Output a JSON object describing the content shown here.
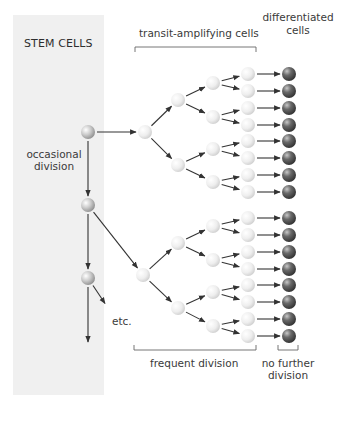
{
  "labels": {
    "stem_cells": "STEM CELLS",
    "transit_amplifying": "transit-amplifying cells",
    "differentiated_1": "differentiated",
    "differentiated_2": "cells",
    "occasional_1": "occasional",
    "occasional_2": "division",
    "etc": "etc.",
    "frequent_division": "frequent division",
    "no_further_1": "no further",
    "no_further_2": "division"
  },
  "colors": {
    "panel": "#f0f0f0",
    "arrow": "#333333",
    "bracket": "#666666",
    "light_cell": "#f2f2f2",
    "stem_cell": "#c9c9c9",
    "dark_cell": "#555555"
  },
  "panel": {
    "x": 13,
    "y": 15,
    "w": 91,
    "h": 380
  },
  "stem_cells": [
    {
      "x": 88,
      "y": 132
    },
    {
      "x": 88,
      "y": 205
    },
    {
      "x": 88,
      "y": 278
    }
  ],
  "stem_line_end_y": 342,
  "trees": [
    {
      "root": {
        "x": 145,
        "y": 132
      },
      "l2": [
        100,
        165
      ],
      "l3": [
        83,
        117,
        149,
        182
      ]
    },
    {
      "root": {
        "x": 143,
        "y": 275
      },
      "l2": [
        243,
        308
      ],
      "l3": [
        226,
        260,
        292,
        326
      ]
    }
  ],
  "level_x": {
    "l2": 178,
    "l3": 213,
    "l4": 248,
    "dark": 289
  },
  "level4_y": [
    74,
    91,
    108,
    125,
    141,
    158,
    175,
    192,
    218,
    235,
    252,
    269,
    285,
    302,
    319,
    336
  ],
  "brackets": {
    "transit": {
      "x1": 135,
      "x2": 256,
      "y": 47
    },
    "frequent": {
      "x1": 134,
      "x2": 256,
      "y": 350
    },
    "no_further": {
      "x1": 278,
      "x2": 298,
      "y": 350
    }
  }
}
